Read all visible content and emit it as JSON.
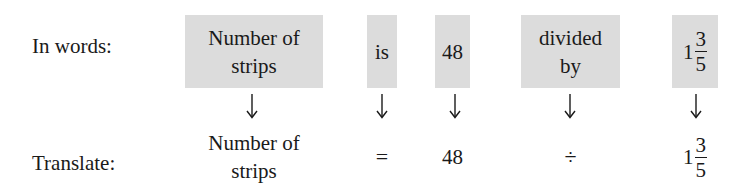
{
  "colors": {
    "box_fill": "#dcdcdc",
    "text": "#1a1a1a",
    "background": "#ffffff"
  },
  "words_row": {
    "label": "In words:",
    "items": [
      {
        "lines": [
          "Number of",
          "strips"
        ]
      },
      {
        "lines": [
          "is"
        ]
      },
      {
        "lines": [
          "48"
        ]
      },
      {
        "lines": [
          "divided",
          "by"
        ]
      },
      {
        "mixed_number": {
          "whole": "1",
          "numerator": "3",
          "denominator": "5"
        }
      }
    ]
  },
  "arrows": {
    "icon": "down-arrow-icon",
    "count": 5
  },
  "translate_row": {
    "label": "Translate:",
    "items": [
      {
        "lines": [
          "Number of",
          "strips"
        ]
      },
      {
        "symbol": "="
      },
      {
        "value": "48"
      },
      {
        "symbol": "÷"
      },
      {
        "mixed_number": {
          "whole": "1",
          "numerator": "3",
          "denominator": "5"
        }
      }
    ]
  }
}
